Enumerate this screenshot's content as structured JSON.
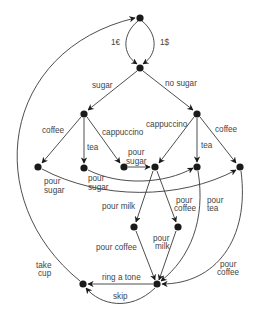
{
  "diagram": {
    "type": "state-transition graph (coffee vending machine)",
    "colors": {
      "edge": "#3a3a3a",
      "node": "#1a1a1a",
      "label": "#444444",
      "background": "#ffffff"
    },
    "nodes": [
      {
        "id": "start",
        "x": 140,
        "y": 18
      },
      {
        "id": "paid",
        "x": 140,
        "y": 68
      },
      {
        "id": "sugar",
        "x": 84,
        "y": 114
      },
      {
        "id": "nosugar",
        "x": 197,
        "y": 114
      },
      {
        "id": "s_coffee",
        "x": 38,
        "y": 167
      },
      {
        "id": "s_tea",
        "x": 84,
        "y": 168
      },
      {
        "id": "s_capp",
        "x": 124,
        "y": 167
      },
      {
        "id": "capp_sugared",
        "x": 155,
        "y": 167
      },
      {
        "id": "n_tea",
        "x": 197,
        "y": 167
      },
      {
        "id": "n_coffee",
        "x": 240,
        "y": 167
      },
      {
        "id": "milk_done",
        "x": 134,
        "y": 227
      },
      {
        "id": "coffee_done",
        "x": 178,
        "y": 227
      },
      {
        "id": "ready",
        "x": 157,
        "y": 284
      },
      {
        "id": "end",
        "x": 83,
        "y": 284
      }
    ],
    "labels": {
      "euro": "1€",
      "dollar": "1$",
      "sugar": "sugar",
      "no_sugar": "no sugar",
      "coffee_left": "coffee",
      "tea_left": "tea",
      "cappuccino_left": "cappuccino",
      "pour_sugar_capp_1": "pour",
      "pour_sugar_capp_2": "sugar",
      "cappuccino_right": "cappuccino",
      "tea_right": "tea",
      "coffee_right": "coffee",
      "pour_sugar_a_1": "pour",
      "pour_sugar_a_2": "sugar",
      "pour_sugar_b_1": "pour",
      "pour_sugar_b_2": "sugar",
      "pour_milk": "pour milk",
      "pour_coffee_mid_1": "pour",
      "pour_coffee_mid_2": "coffee",
      "pour_tea_1": "pour",
      "pour_tea_2": "tea",
      "pour_coffee_low": "pour coffee",
      "pour_milk_low_1": "pour",
      "pour_milk_low_2": "milk",
      "pour_coffee_right_1": "pour",
      "pour_coffee_right_2": "coffee",
      "take_cup_1": "take",
      "take_cup_2": "cup",
      "ring_a_tone": "ring a tone",
      "skip": "skip"
    }
  }
}
